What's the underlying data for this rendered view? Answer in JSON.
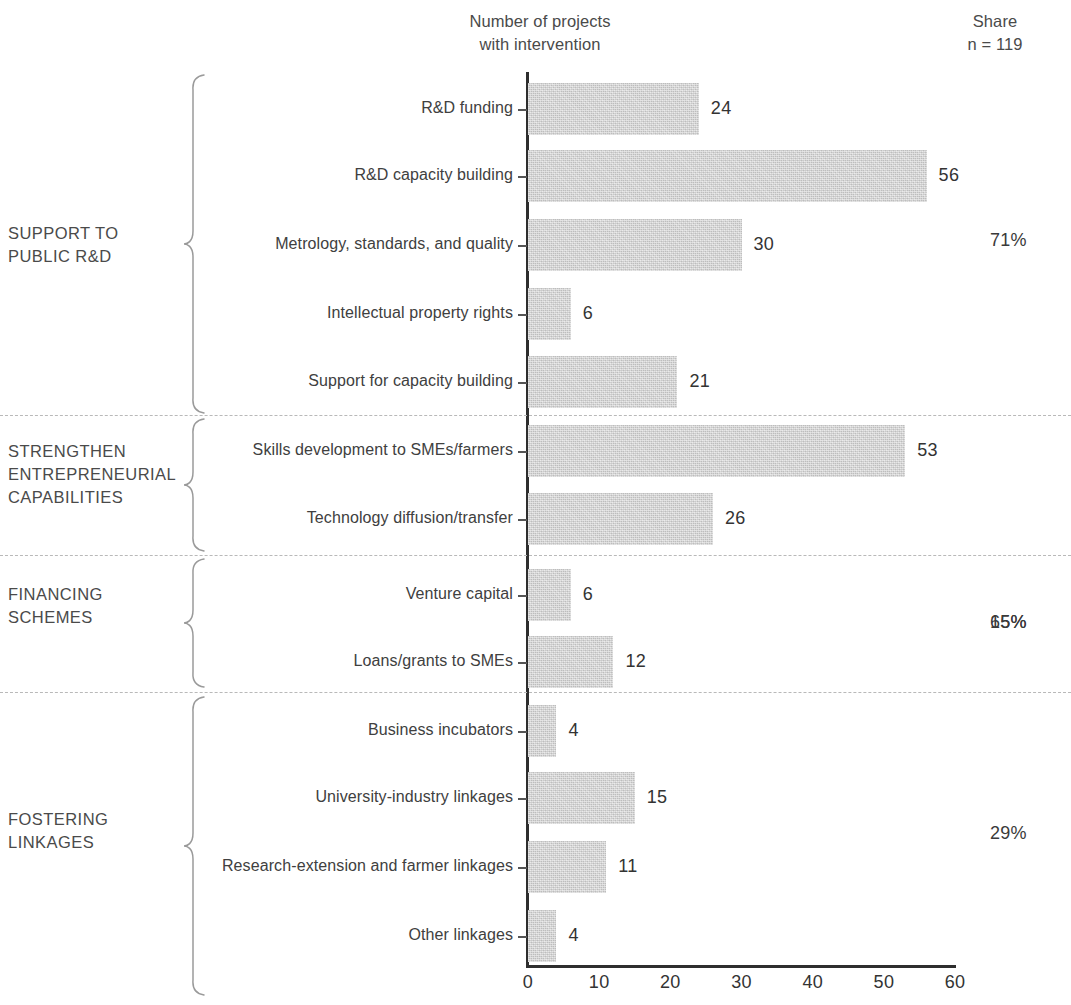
{
  "header": {
    "axis_title_line1": "Number of projects",
    "axis_title_line2": "with intervention",
    "share_label": "Share",
    "n_label": "n = 119"
  },
  "chart_data": {
    "type": "bar",
    "orientation": "horizontal",
    "title": "Number of projects with intervention",
    "xlabel": "",
    "ylabel": "",
    "xlim": [
      0,
      60
    ],
    "xticks": [
      0,
      10,
      20,
      30,
      40,
      50,
      60
    ],
    "grid": false,
    "legend": null,
    "total_n": 119,
    "bar_color": "#d3d3d3",
    "categories": [
      "R&D funding",
      "R&D capacity building",
      "Metrology, standards, and quality",
      "Intellectual property rights",
      "Support for capacity building",
      "Skills development to SMEs/farmers",
      "Technology diffusion/transfer",
      "Venture capital",
      "Loans/grants to SMEs",
      "Business incubators",
      "University-industry linkages",
      "Research-extension and farmer linkages",
      "Other linkages"
    ],
    "values": [
      24,
      56,
      30,
      6,
      21,
      53,
      26,
      6,
      12,
      4,
      15,
      11,
      4
    ],
    "groups": [
      {
        "name": "SUPPORT TO\nPUBLIC R&D",
        "share": "71%",
        "categories": [
          "R&D funding",
          "R&D capacity building",
          "Metrology, standards, and quality",
          "Intellectual property rights",
          "Support for capacity building"
        ],
        "values": [
          24,
          56,
          30,
          6,
          21
        ]
      },
      {
        "name": "STRENGTHEN\nENTREPRENEURIAL\nCAPABILITIES",
        "share": "65%",
        "categories": [
          "Skills development to SMEs/farmers",
          "Technology diffusion/transfer"
        ],
        "values": [
          53,
          26
        ]
      },
      {
        "name": "FINANCING\nSCHEMES",
        "share": "15%",
        "categories": [
          "Venture capital",
          "Loans/grants to SMEs"
        ],
        "values": [
          6,
          12
        ]
      },
      {
        "name": "FOSTERING\nLINKAGES",
        "share": "29%",
        "categories": [
          "Business incubators",
          "University-industry linkages",
          "Research-extension and farmer linkages",
          "Other linkages"
        ],
        "values": [
          4,
          15,
          11,
          4
        ]
      }
    ]
  },
  "bars": [
    {
      "label": "R&D funding",
      "value": 24,
      "value_text": "24"
    },
    {
      "label": "R&D capacity building",
      "value": 56,
      "value_text": "56"
    },
    {
      "label": "Metrology, standards, and quality",
      "value": 30,
      "value_text": "30"
    },
    {
      "label": "Intellectual property rights",
      "value": 6,
      "value_text": "6"
    },
    {
      "label": "Support for capacity building",
      "value": 21,
      "value_text": "21"
    },
    {
      "label": "Skills development to SMEs/farmers",
      "value": 53,
      "value_text": "53"
    },
    {
      "label": "Technology diffusion/transfer",
      "value": 26,
      "value_text": "26"
    },
    {
      "label": "Venture capital",
      "value": 6,
      "value_text": "6"
    },
    {
      "label": "Loans/grants to SMEs",
      "value": 12,
      "value_text": "12"
    },
    {
      "label": "Business incubators",
      "value": 4,
      "value_text": "4"
    },
    {
      "label": "University-industry linkages",
      "value": 15,
      "value_text": "15"
    },
    {
      "label": "Research-extension and farmer linkages",
      "value": 11,
      "value_text": "11"
    },
    {
      "label": "Other linkages",
      "value": 4,
      "value_text": "4"
    }
  ],
  "xticks": [
    {
      "text": "0"
    },
    {
      "text": "10"
    },
    {
      "text": "20"
    },
    {
      "text": "30"
    },
    {
      "text": "40"
    },
    {
      "text": "50"
    },
    {
      "text": "60"
    }
  ],
  "groups": [
    {
      "name": "SUPPORT TO\nPUBLIC R&D",
      "share": "71%"
    },
    {
      "name": "STRENGTHEN\nENTREPRENEURIAL\nCAPABILITIES",
      "share": "65%"
    },
    {
      "name": "FINANCING\nSCHEMES",
      "share": "15%"
    },
    {
      "name": "FOSTERING\nLINKAGES",
      "share": "29%"
    }
  ]
}
